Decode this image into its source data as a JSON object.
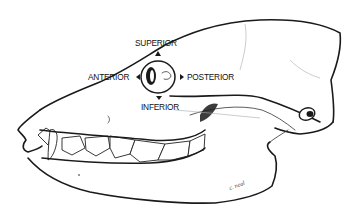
{
  "figure": {
    "labels": {
      "superior": "SUPERIOR",
      "anterior": "ANTERIOR",
      "posterior": "POSTERIOR",
      "inferior": "INFERIOR"
    },
    "signature": "c. neal",
    "colors": {
      "ink": "#1a1a1a",
      "background": "#ffffff"
    }
  }
}
